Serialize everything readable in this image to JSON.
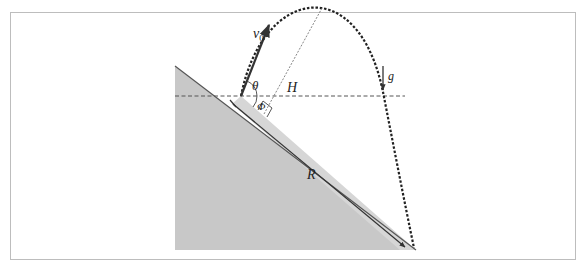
{
  "figure": {
    "labels": {
      "v0": "v",
      "v0_sub": "0",
      "theta": "θ",
      "phi": "Φ",
      "H": "H",
      "g": "g",
      "R": "R"
    },
    "colors": {
      "frame": "#bdbdbd",
      "slope_fill": "#c8c8c8",
      "slope_edge": "#555555",
      "strip_fill": "#d4d4d4",
      "trajectory": "#222222",
      "vector": "#333333",
      "guide_lines": "#555555",
      "background": "#ffffff"
    },
    "elements": [
      "inclined-plane",
      "launch-velocity-vector",
      "parabolic-trajectory",
      "horizontal-reference-line",
      "max-height-perpendicular",
      "range-arrow-along-slope",
      "gravity-arrow",
      "right-angle-marker"
    ]
  }
}
